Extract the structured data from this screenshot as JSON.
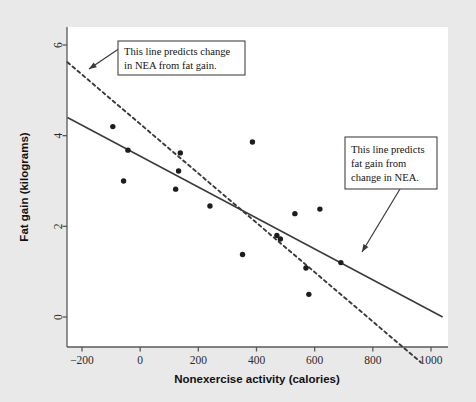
{
  "figure": {
    "background_color": "#e9e9e9",
    "panel_color": "#ffffff",
    "width": 476,
    "height": 402
  },
  "chart_data": {
    "type": "scatter",
    "title": "",
    "xlabel": "Nonexercise activity (calories)",
    "ylabel": "Fat gain (kilograms)",
    "xlim": [
      -250,
      1040
    ],
    "ylim": [
      -1.2,
      6.2
    ],
    "xticks": [
      -200,
      0,
      200,
      400,
      600,
      800,
      1000
    ],
    "xticklabels": [
      "−200",
      "0",
      "200",
      "400",
      "600",
      "800",
      "1000"
    ],
    "yticks": [
      0,
      2,
      4,
      6
    ],
    "yticklabels": [
      "0",
      "2",
      "4",
      "6"
    ],
    "grid": false,
    "legend": "none",
    "point_color": "#1d1d1d",
    "line_color": "#3a3a3a",
    "points": [
      {
        "x": -94,
        "y": 4.2
      },
      {
        "x": -57,
        "y": 3.0
      },
      {
        "x": -42,
        "y": 3.68
      },
      {
        "x": 122,
        "y": 2.82
      },
      {
        "x": 132,
        "y": 3.22
      },
      {
        "x": 138,
        "y": 3.62
      },
      {
        "x": 240,
        "y": 2.45
      },
      {
        "x": 352,
        "y": 1.38
      },
      {
        "x": 386,
        "y": 3.86
      },
      {
        "x": 470,
        "y": 1.8
      },
      {
        "x": 482,
        "y": 1.72
      },
      {
        "x": 532,
        "y": 2.28
      },
      {
        "x": 570,
        "y": 1.08
      },
      {
        "x": 580,
        "y": 0.5
      },
      {
        "x": 618,
        "y": 2.38
      },
      {
        "x": 690,
        "y": 1.2
      }
    ],
    "series": [
      {
        "name": "This line predicts fat gain from change in NEA.",
        "style": "solid",
        "x_endpoints": [
          -250,
          1040
        ],
        "y_endpoints": [
          4.4,
          0.0
        ],
        "slope": -0.00341,
        "intercept": 3.548
      },
      {
        "name": "This line predicts change in NEA from fat gain.",
        "style": "dashed",
        "x_endpoints": [
          -250,
          965
        ],
        "y_endpoints": [
          5.62,
          -1.0
        ],
        "slope": -0.00545,
        "intercept": 4.258
      }
    ]
  },
  "annotations": [
    {
      "id": "callout-nea-from-fat-gain",
      "line1": "This line predicts change",
      "line2": "in NEA from fat gain.",
      "line3": "",
      "box": {
        "x": 118,
        "y": 41,
        "w": 127,
        "h": 34
      },
      "leader": {
        "x1": 120,
        "y1": 48,
        "x2": 89,
        "y2": 69
      },
      "target": {
        "x": 89,
        "y": 69
      }
    },
    {
      "id": "callout-fat-gain-from-nea",
      "line1": "This line predicts",
      "line2": "fat gain from",
      "line3": "change in NEA.",
      "box": {
        "x": 345,
        "y": 137,
        "w": 92,
        "h": 52
      },
      "leader": {
        "x1": 400,
        "y1": 189,
        "x2": 362,
        "y2": 252
      },
      "target": {
        "x": 362,
        "y": 252
      }
    }
  ]
}
